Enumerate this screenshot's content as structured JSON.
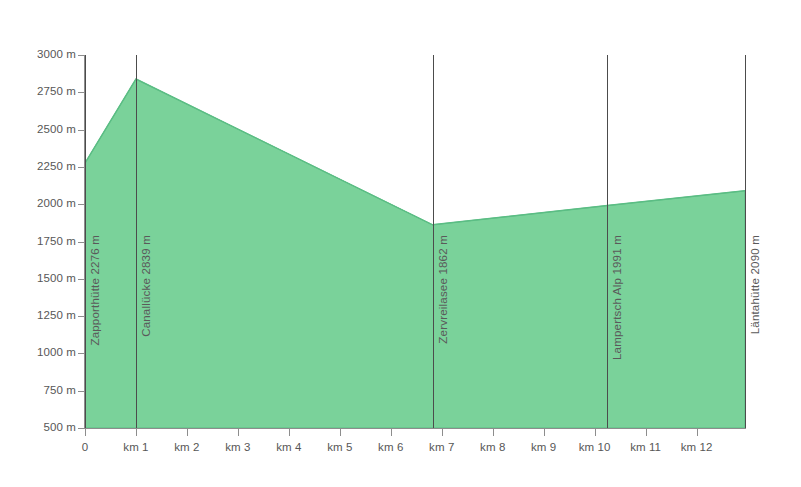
{
  "chart_data": {
    "type": "area",
    "title": "",
    "subtitle": "",
    "xlabel": "",
    "ylabel": "",
    "xlim": [
      0,
      12.95
    ],
    "ylim": [
      500,
      3000
    ],
    "grid": false,
    "legend": "none",
    "fill_color": "#7ad29a",
    "line_color": "#5bbd84",
    "axis_color": "#8d8d8d",
    "label_color": "#575757",
    "marker_line_color": "#4c4c4c",
    "y_ticks": [
      {
        "value": 3000,
        "label": "3000 m"
      },
      {
        "value": 2750,
        "label": "2750 m"
      },
      {
        "value": 2500,
        "label": "2500 m"
      },
      {
        "value": 2250,
        "label": "2250 m"
      },
      {
        "value": 2000,
        "label": "2000 m"
      },
      {
        "value": 1750,
        "label": "1750 m"
      },
      {
        "value": 1500,
        "label": "1500 m"
      },
      {
        "value": 1250,
        "label": "1250 m"
      },
      {
        "value": 1000,
        "label": "1000 m"
      },
      {
        "value": 750,
        "label": "750 m"
      },
      {
        "value": 500,
        "label": "500 m"
      }
    ],
    "x_ticks": [
      {
        "value": 0,
        "label": "0"
      },
      {
        "value": 1,
        "label": "km 1"
      },
      {
        "value": 2,
        "label": "km 2"
      },
      {
        "value": 3,
        "label": "km 3"
      },
      {
        "value": 4,
        "label": "km 4"
      },
      {
        "value": 5,
        "label": "km 5"
      },
      {
        "value": 6,
        "label": "km 6"
      },
      {
        "value": 7,
        "label": "km 7"
      },
      {
        "value": 8,
        "label": "km 8"
      },
      {
        "value": 9,
        "label": "km 9"
      },
      {
        "value": 10,
        "label": "km 10"
      },
      {
        "value": 11,
        "label": "km 11"
      },
      {
        "value": 12,
        "label": "km 12"
      }
    ],
    "x": [
      0,
      1.0,
      6.82,
      10.25,
      12.95
    ],
    "y": [
      2276,
      2839,
      1862,
      1991,
      2090
    ],
    "waypoints": [
      {
        "name": "Zapporthütte",
        "elevation": 2276,
        "label": "Zapporthütte  2276 m",
        "km": 0.0
      },
      {
        "name": "Canallücke",
        "elevation": 2839,
        "label": "Canallücke  2839 m",
        "km": 1.0
      },
      {
        "name": "Zervreilasee",
        "elevation": 1862,
        "label": "Zervreilasee  1862 m",
        "km": 6.82
      },
      {
        "name": "Lampertsch Alp",
        "elevation": 1991,
        "label": "Lampertsch Alp  1991 m",
        "km": 10.25
      },
      {
        "name": "Läntahütte",
        "elevation": 2090,
        "label": "Läntahütte  2090 m",
        "km": 12.95
      }
    ]
  }
}
